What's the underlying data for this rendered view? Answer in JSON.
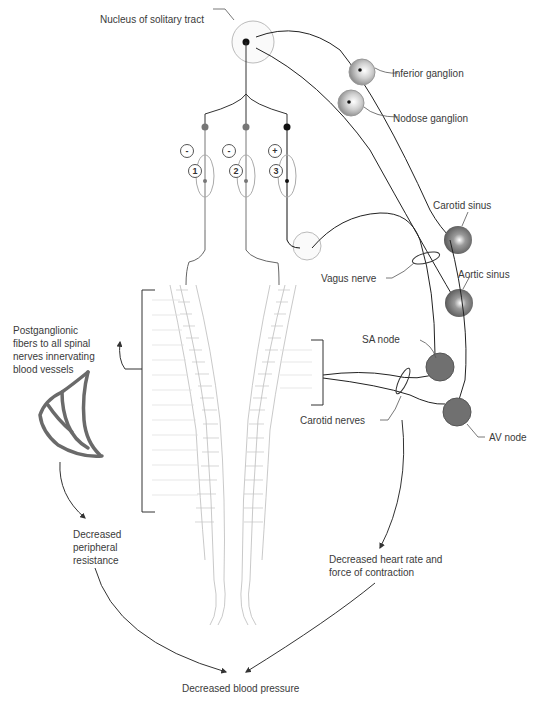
{
  "diagram": {
    "labels": {
      "nucleus": "Nucleus of solitary tract",
      "inferior_ganglion": "Inferior ganglion",
      "nodose_ganglion": "Nodose ganglion",
      "carotid_sinus": "Carotid sinus",
      "aortic_sinus": "Aortic sinus",
      "vagus_nerve": "Vagus nerve",
      "sa_node": "SA node",
      "carotid_nerves": "Carotid nerves",
      "av_node": "AV node",
      "postganglionic": "Postganglionic fibers to all spinal nerves innervating blood vessels",
      "decreased_resistance": "Decreased peripheral resistance",
      "decreased_heart": "Decreased heart rate and force of contraction",
      "decreased_bp": "Decreased blood pressure"
    },
    "pathways": [
      {
        "number": "1",
        "sign": "-"
      },
      {
        "number": "2",
        "sign": "-"
      },
      {
        "number": "3",
        "sign": "+"
      }
    ],
    "colors": {
      "line": "#333333",
      "light_line": "#bbbbbb",
      "sinus": "#6a6a6a",
      "ganglion": "#bdbdbd"
    }
  }
}
